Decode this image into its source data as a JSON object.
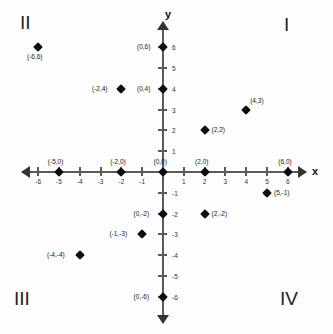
{
  "figure": {
    "type": "cartesian-coordinate-plane",
    "axis_x_label": "x",
    "axis_y_label": "y",
    "axis_range": [
      -6,
      6
    ],
    "origin_px": [
      163,
      172
    ],
    "unit_px": 20.8
  },
  "quadrants": [
    {
      "name": "quadrant-1",
      "label": "I"
    },
    {
      "name": "quadrant-2",
      "label": "II"
    },
    {
      "name": "quadrant-3",
      "label": "III"
    },
    {
      "name": "quadrant-4",
      "label": "IV"
    }
  ],
  "x_ticks": [
    {
      "value": -6,
      "label": "-6"
    },
    {
      "value": -5,
      "label": "-5"
    },
    {
      "value": -4,
      "label": "-4"
    },
    {
      "value": -3,
      "label": "-3"
    },
    {
      "value": -2,
      "label": "-2"
    },
    {
      "value": -1,
      "label": "-1"
    },
    {
      "value": 1,
      "label": "1"
    },
    {
      "value": 2,
      "label": "2"
    },
    {
      "value": 3,
      "label": "3"
    },
    {
      "value": 4,
      "label": "4"
    },
    {
      "value": 5,
      "label": "5"
    },
    {
      "value": 6,
      "label": "6"
    }
  ],
  "y_ticks": [
    {
      "value": 6,
      "label": "6"
    },
    {
      "value": 5,
      "label": "5"
    },
    {
      "value": 4,
      "label": "4"
    },
    {
      "value": 3,
      "label": "3"
    },
    {
      "value": 2,
      "label": "2"
    },
    {
      "value": 1,
      "label": "1"
    },
    {
      "value": -1,
      "label": "-1"
    },
    {
      "value": -2,
      "label": "-2"
    },
    {
      "value": -3,
      "label": "-3"
    },
    {
      "value": -4,
      "label": "-4"
    },
    {
      "value": -5,
      "label": "-5"
    },
    {
      "value": -6,
      "label": "-6"
    }
  ],
  "points": [
    {
      "x": -6,
      "y": 6,
      "label": "(-6,6)",
      "label_pos": "below"
    },
    {
      "x": -2,
      "y": 4,
      "label": "(-2,4)",
      "label_pos": "left"
    },
    {
      "x": 0,
      "y": 6,
      "label": "(0,6)",
      "label_pos": "left"
    },
    {
      "x": 0,
      "y": 4,
      "label": "(0,4)",
      "label_pos": "left"
    },
    {
      "x": 4,
      "y": 3,
      "label": "(4,3)",
      "label_pos": "above-right"
    },
    {
      "x": 2,
      "y": 2,
      "label": "(2,2)",
      "label_pos": "right"
    },
    {
      "x": -5,
      "y": 0,
      "label": "(-5,0)",
      "label_pos": "above"
    },
    {
      "x": -2,
      "y": 0,
      "label": "(-2,0)",
      "label_pos": "above"
    },
    {
      "x": 0,
      "y": 0,
      "label": "(0,0)",
      "label_pos": "above"
    },
    {
      "x": 2,
      "y": 0,
      "label": "(2,0)",
      "label_pos": "above"
    },
    {
      "x": 6,
      "y": 0,
      "label": "(6,0)",
      "label_pos": "above"
    },
    {
      "x": 5,
      "y": -1,
      "label": "(5,-1)",
      "label_pos": "right"
    },
    {
      "x": 0,
      "y": -2,
      "label": "(0,-2)",
      "label_pos": "left"
    },
    {
      "x": 2,
      "y": -2,
      "label": "(2,-2)",
      "label_pos": "right"
    },
    {
      "x": -1,
      "y": -3,
      "label": "(-1,-3)",
      "label_pos": "left"
    },
    {
      "x": -4,
      "y": -4,
      "label": "(-4,-4)",
      "label_pos": "left"
    },
    {
      "x": 0,
      "y": -6,
      "label": "(0,-6)",
      "label_pos": "left"
    }
  ],
  "colors": {
    "axis": "#5a5a5a",
    "marker": "#0d0d0d",
    "text": "#1a1a1a",
    "background": "#fdfdfd"
  }
}
